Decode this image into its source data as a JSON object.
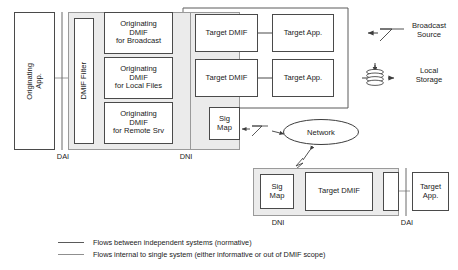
{
  "diagram": {
    "colors": {
      "band_fill": "#ebebeb",
      "band_stroke": "#9a9a9a",
      "box_stroke": "#4a4a4a",
      "line_normative": "#5a5a5a",
      "line_internal": "#8f8f8f",
      "text": "#1a1a1a"
    }
  },
  "originating_system": {
    "originating_app": {
      "label": "Originating\nApp."
    },
    "dmif_filter": {
      "label": "DMIF Filter"
    },
    "originating_dmif": [
      {
        "label": "Originating\nDMIF\nfor Broadcast"
      },
      {
        "label": "Originating\nDMIF\nfor Local Files"
      },
      {
        "label": "Originating\nDMIF\nfor Remote Srv"
      }
    ],
    "target_dmif": [
      {
        "label": "Target DMIF"
      },
      {
        "label": "Target DMIF"
      }
    ],
    "target_app": [
      {
        "label": "Target App."
      },
      {
        "label": "Target App."
      }
    ],
    "sig_map": {
      "label": "Sig\nMap"
    },
    "interface_tags": {
      "dai": "DAI",
      "dni": "DNI"
    }
  },
  "external_entities": {
    "broadcast_source": {
      "label": "Broadcast\nSource",
      "icon": "lightning-icon"
    },
    "local_storage": {
      "label": "Local\nStorage",
      "icon": "disk-stack-icon"
    },
    "network": {
      "label": "Network",
      "icon": "ellipse-shape"
    }
  },
  "remote_system": {
    "sig_map": {
      "label": "Sig\nMap"
    },
    "target_dmif": {
      "label": "Target DMIF"
    },
    "dmif_filter": {
      "label": ""
    },
    "target_app": {
      "label": "Target\nApp."
    },
    "interface_tags": {
      "dni": "DNI",
      "dai": "DAI"
    }
  },
  "legend": {
    "items": [
      {
        "kind": "normative",
        "text": "Flows between independent systems (normative)"
      },
      {
        "kind": "internal",
        "text": "Flows internal to single system (either informative or out of DMIF scope)"
      }
    ]
  }
}
